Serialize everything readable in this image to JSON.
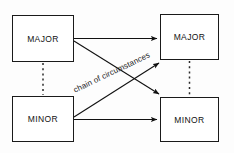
{
  "diagram": {
    "background_color": "#fdfdfd",
    "stroke_color": "#1a1a1a",
    "nodes": [
      {
        "id": "major-left",
        "label": "MAJOR",
        "position": "top-left"
      },
      {
        "id": "major-right",
        "label": "MAJOR",
        "position": "top-right"
      },
      {
        "id": "minor-left",
        "label": "MINOR",
        "position": "bottom-left"
      },
      {
        "id": "minor-right",
        "label": "MINOR",
        "position": "bottom-right"
      }
    ],
    "edges": [
      {
        "id": "major-to-major",
        "from": "major-left",
        "to": "major-right",
        "style": "solid",
        "arrow": true,
        "orientation": "horizontal"
      },
      {
        "id": "minor-to-minor",
        "from": "minor-left",
        "to": "minor-right",
        "style": "solid",
        "arrow": true,
        "orientation": "horizontal"
      },
      {
        "id": "major-left-to-minor-left",
        "from": "major-left",
        "to": "minor-left",
        "style": "dashed",
        "arrow": false,
        "orientation": "vertical"
      },
      {
        "id": "major-right-to-minor-right",
        "from": "major-right",
        "to": "minor-right",
        "style": "dashed",
        "arrow": false,
        "orientation": "vertical"
      },
      {
        "id": "major-left-to-minor-right",
        "from": "major-left",
        "to": "minor-right",
        "style": "solid",
        "arrow": true,
        "orientation": "diagonal-down"
      },
      {
        "id": "minor-left-to-major-right",
        "from": "minor-left",
        "to": "major-right",
        "style": "solid",
        "arrow": true,
        "orientation": "diagonal-up",
        "label": "chain of circumstances"
      }
    ],
    "edge_label": "chain of circumstances"
  }
}
